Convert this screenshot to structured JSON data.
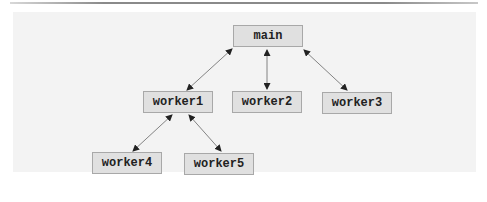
{
  "diagram": {
    "type": "tree",
    "nodes": [
      {
        "id": "main",
        "label": "main"
      },
      {
        "id": "worker1",
        "label": "worker1"
      },
      {
        "id": "worker2",
        "label": "worker2"
      },
      {
        "id": "worker3",
        "label": "worker3"
      },
      {
        "id": "worker4",
        "label": "worker4"
      },
      {
        "id": "worker5",
        "label": "worker5"
      }
    ],
    "edges": [
      {
        "from": "main",
        "to": "worker1",
        "arrows": "both"
      },
      {
        "from": "main",
        "to": "worker2",
        "arrows": "both"
      },
      {
        "from": "main",
        "to": "worker3",
        "arrows": "both"
      },
      {
        "from": "worker1",
        "to": "worker4",
        "arrows": "both"
      },
      {
        "from": "worker1",
        "to": "worker5",
        "arrows": "both"
      }
    ],
    "colors": {
      "node_fill": "#e0e0e0",
      "node_border": "#a8a8a8",
      "edge": "#555555",
      "panel": "#f3f3f3"
    }
  }
}
